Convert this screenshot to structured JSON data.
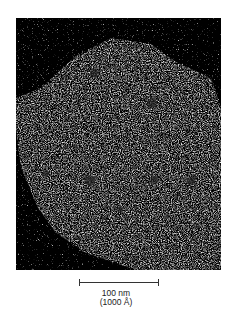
{
  "image": {
    "description": "Electron micrograph of a spherical particle with faceted, grainy white surface on dark background",
    "colors": {
      "background": "#000000",
      "particle": "#d8d8d8",
      "page": "#ffffff"
    }
  },
  "scale_bar": {
    "label": "100 nm",
    "sublabel": "(1000 Å)"
  }
}
